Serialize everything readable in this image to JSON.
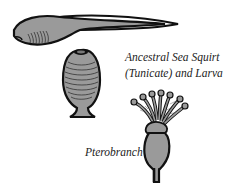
{
  "figure": {
    "labels": {
      "tunicate_line1": "Ancestral Sea Squirt",
      "tunicate_line2": "(Tunicate) and Larva",
      "pterobranch": "Pterobranch"
    },
    "organisms": [
      {
        "id": "larva",
        "name": "Tunicate larva (tadpole)"
      },
      {
        "id": "adult-sea-squirt",
        "name": "Ancestral sea squirt (adult tunicate)"
      },
      {
        "id": "pterobranch",
        "name": "Pterobranch"
      }
    ],
    "colors": {
      "fill": "#9a9a9a",
      "outline": "#111111",
      "background": "#ffffff",
      "text": "#222222"
    }
  }
}
